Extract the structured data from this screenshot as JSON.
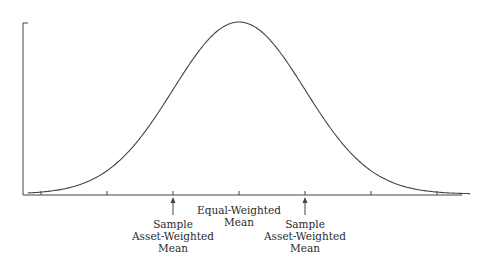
{
  "diagram": {
    "type": "distribution-curve",
    "line_color": "#444444",
    "text_color": "#2a2a2a",
    "curve": {
      "shape": "normal",
      "mean": 0,
      "std": 1,
      "x_range": [
        -3.2,
        3.5
      ]
    },
    "axis": {
      "tick_positions": [
        -3.0,
        -2.0,
        -1.0,
        0.0,
        1.0,
        2.0,
        3.0
      ]
    },
    "annotations": [
      {
        "id": "left-sample",
        "x": -1.0,
        "lines": [
          "Sample",
          "Asset-Weighted",
          "Mean"
        ],
        "arrow": true
      },
      {
        "id": "center",
        "x": 0.0,
        "lines": [
          "Equal-Weighted",
          "Mean"
        ],
        "arrow": false
      },
      {
        "id": "right-sample",
        "x": 1.0,
        "lines": [
          "Sample",
          "Asset-Weighted",
          "Mean"
        ],
        "arrow": true
      }
    ]
  }
}
